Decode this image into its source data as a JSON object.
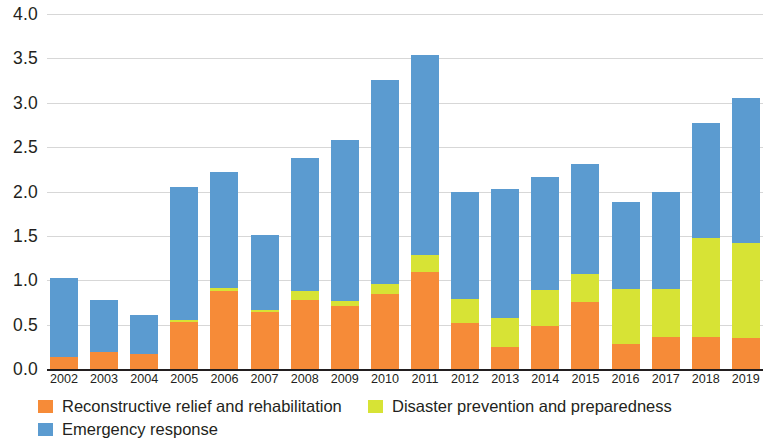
{
  "chart_data": {
    "type": "bar",
    "subtype": "stacked-bar",
    "title": "",
    "xlabel": "",
    "ylabel": "",
    "ylim": [
      0.0,
      4.0
    ],
    "ytick_step": 0.5,
    "grid": true,
    "legend_position": "bottom-left",
    "categories": [
      "2002",
      "2003",
      "2004",
      "2005",
      "2006",
      "2007",
      "2008",
      "2009",
      "2010",
      "2011",
      "2012",
      "2013",
      "2014",
      "2015",
      "2016",
      "2017",
      "2018",
      "2019"
    ],
    "ytick_labels": [
      "4.0",
      "3.5",
      "3.0",
      "2.5",
      "2.0",
      "1.5",
      "1.0",
      "0.5",
      "0.0"
    ],
    "series": [
      {
        "name": "Reconstructive relief and rehabilitation",
        "color": "#f68b38",
        "values": [
          0.14,
          0.19,
          0.17,
          0.53,
          0.88,
          0.64,
          0.78,
          0.71,
          0.85,
          1.09,
          0.52,
          0.25,
          0.49,
          0.75,
          0.28,
          0.36,
          0.36,
          0.35
        ]
      },
      {
        "name": "Disaster prevention and preparedness",
        "color": "#d7e335",
        "values": [
          0.0,
          0.0,
          0.0,
          0.02,
          0.03,
          0.03,
          0.1,
          0.06,
          0.11,
          0.19,
          0.27,
          0.32,
          0.4,
          0.32,
          0.62,
          0.54,
          1.12,
          1.07
        ]
      },
      {
        "name": "Emergency response",
        "color": "#5b9bd0",
        "values": [
          0.89,
          0.59,
          0.44,
          1.5,
          1.31,
          0.84,
          1.5,
          1.81,
          2.3,
          2.26,
          1.21,
          1.46,
          1.27,
          1.24,
          0.98,
          1.1,
          1.29,
          1.63
        ]
      }
    ],
    "totals": [
      1.03,
      0.78,
      0.61,
      2.05,
      2.22,
      1.51,
      2.38,
      2.58,
      3.26,
      3.54,
      2.0,
      2.03,
      2.16,
      2.31,
      1.88,
      2.0,
      2.77,
      3.05
    ]
  },
  "legend": {
    "items": [
      {
        "label": "Reconstructive relief and rehabilitation",
        "color": "#f68b38",
        "swatch_icon": "legend-swatch-icon"
      },
      {
        "label": "Disaster prevention and preparedness",
        "color": "#d7e335",
        "swatch_icon": "legend-swatch-icon"
      },
      {
        "label": "Emergency response",
        "color": "#5b9bd0",
        "swatch_icon": "legend-swatch-icon"
      }
    ]
  }
}
